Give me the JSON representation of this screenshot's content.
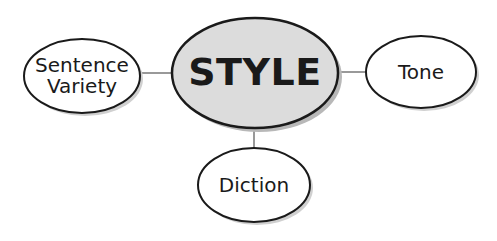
{
  "diagram": {
    "type": "concept-map",
    "center": {
      "label": "STYLE",
      "fill": "#dcdcdc"
    },
    "nodes": [
      {
        "id": "sentence-variety",
        "line1": "Sentence",
        "line2": "Variety",
        "position": "left"
      },
      {
        "id": "tone",
        "label": "Tone",
        "position": "right"
      },
      {
        "id": "diction",
        "label": "Diction",
        "position": "bottom"
      }
    ],
    "colors": {
      "stroke": "#1a1a1a",
      "connector": "#999999",
      "shadow": "#b8b8b8",
      "node_fill": "#ffffff"
    }
  }
}
